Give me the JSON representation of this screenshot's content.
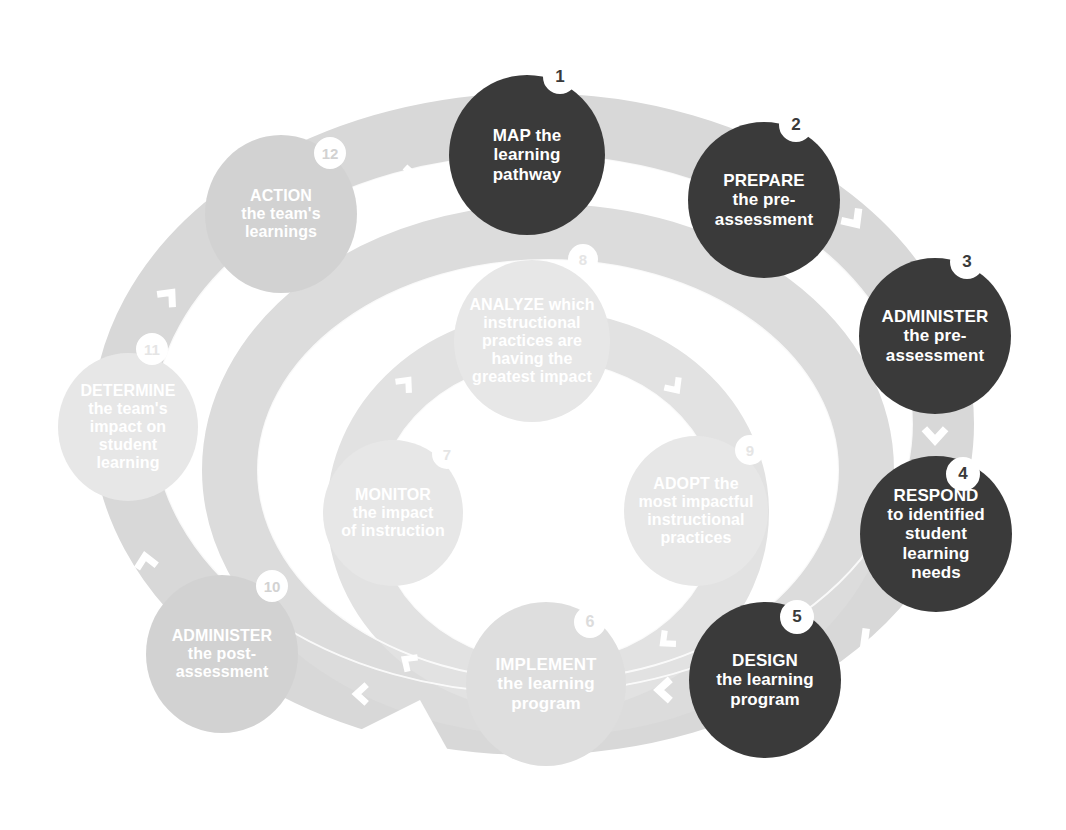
{
  "diagram": {
    "colors": {
      "active_fill": "#3a3a3a",
      "dim_fill": "#d2d2d2",
      "faint_fill": "#dedede",
      "faintest_fill": "#e7e7e7",
      "track": "#d8d8d8",
      "track_inner": "#dcdcdc",
      "arrow": "#ffffff",
      "text_on_active": "#ffffff",
      "background": "#ffffff"
    },
    "outer_ring_label": "outer-cycle-track",
    "inner_ring_label": "inner-cycle-track",
    "steps": [
      {
        "number": "1",
        "state": "active",
        "lines": [
          "MAP the",
          "learning",
          "pathway"
        ],
        "cx": 527,
        "cy": 155,
        "rx": 78,
        "ry": 80,
        "font": 17,
        "badge_x": 560,
        "badge_y": 77,
        "badge_r": 17,
        "badge_font": 17
      },
      {
        "number": "2",
        "state": "active",
        "lines": [
          "PREPARE",
          "the pre-",
          "assessment"
        ],
        "cx": 764,
        "cy": 200,
        "rx": 76,
        "ry": 78,
        "font": 17,
        "badge_x": 796,
        "badge_y": 125,
        "badge_r": 17,
        "badge_font": 17
      },
      {
        "number": "3",
        "state": "active",
        "lines": [
          "ADMINISTER",
          "the pre-",
          "assessment"
        ],
        "cx": 935,
        "cy": 336,
        "rx": 76,
        "ry": 78,
        "font": 17,
        "badge_x": 967,
        "badge_y": 262,
        "badge_r": 17,
        "badge_font": 17
      },
      {
        "number": "4",
        "state": "active",
        "lines": [
          "RESPOND",
          "to identified",
          "student",
          "learning",
          "needs"
        ],
        "cx": 936,
        "cy": 534,
        "rx": 76,
        "ry": 78,
        "font": 17,
        "badge_x": 963,
        "badge_y": 474,
        "badge_r": 17,
        "badge_font": 17
      },
      {
        "number": "5",
        "state": "active",
        "lines": [
          "DESIGN",
          "the learning",
          "program"
        ],
        "cx": 765,
        "cy": 680,
        "rx": 76,
        "ry": 78,
        "font": 17,
        "badge_x": 797,
        "badge_y": 617,
        "badge_r": 17,
        "badge_font": 17
      },
      {
        "number": "6",
        "state": "faint",
        "lines": [
          "IMPLEMENT",
          "the learning",
          "program"
        ],
        "cx": 546,
        "cy": 684,
        "rx": 80,
        "ry": 82,
        "font": 17,
        "badge_x": 590,
        "badge_y": 622,
        "badge_r": 16,
        "badge_font": 16
      },
      {
        "number": "7",
        "state": "faintest",
        "lines": [
          "MONITOR",
          "the impact",
          "of instruction"
        ],
        "cx": 393,
        "cy": 513,
        "rx": 70,
        "ry": 73,
        "font": 16,
        "badge_x": 447,
        "badge_y": 454,
        "badge_r": 15,
        "badge_font": 15
      },
      {
        "number": "8",
        "state": "faintest",
        "lines": [
          "ANALYZE which",
          "instructional",
          "practices are",
          "having the",
          "greatest impact"
        ],
        "cx": 532,
        "cy": 341,
        "rx": 78,
        "ry": 81,
        "font": 16,
        "badge_x": 583,
        "badge_y": 259,
        "badge_r": 15,
        "badge_font": 15
      },
      {
        "number": "9",
        "state": "faintest",
        "lines": [
          "ADOPT the",
          "most impactful",
          "instructional",
          "practices"
        ],
        "cx": 696,
        "cy": 511,
        "rx": 72,
        "ry": 75,
        "font": 16,
        "badge_x": 750,
        "badge_y": 450,
        "badge_r": 15,
        "badge_font": 15
      },
      {
        "number": "10",
        "state": "dim",
        "lines": [
          "ADMINISTER",
          "the post-",
          "assessment"
        ],
        "cx": 222,
        "cy": 654,
        "rx": 76,
        "ry": 79,
        "font": 16,
        "badge_x": 272,
        "badge_y": 586,
        "badge_r": 16,
        "badge_font": 15
      },
      {
        "number": "11",
        "state": "faintest",
        "lines": [
          "DETERMINE",
          "the team's",
          "impact on",
          "student",
          "learning"
        ],
        "cx": 128,
        "cy": 427,
        "rx": 70,
        "ry": 74,
        "font": 16,
        "badge_x": 152,
        "badge_y": 349,
        "badge_r": 16,
        "badge_font": 15
      },
      {
        "number": "12",
        "state": "dim",
        "lines": [
          "ACTION",
          "the team's",
          "learnings"
        ],
        "cx": 281,
        "cy": 214,
        "rx": 76,
        "ry": 79,
        "font": 16,
        "badge_x": 330,
        "badge_y": 153,
        "badge_r": 16,
        "badge_font": 15
      }
    ],
    "arrows": [
      {
        "name": "arrow-1-to-2",
        "x": 634,
        "y": 178,
        "rot": 0,
        "size": 34
      },
      {
        "name": "arrow-2-to-3",
        "x": 853,
        "y": 219,
        "rot": 55,
        "size": 34
      },
      {
        "name": "arrow-3-to-4",
        "x": 935,
        "y": 434,
        "rot": 90,
        "size": 34
      },
      {
        "name": "arrow-4-to-5",
        "x": 869,
        "y": 640,
        "rot": 140,
        "size": 34
      },
      {
        "name": "arrow-5-to-6",
        "x": 665,
        "y": 690,
        "rot": 180,
        "size": 34
      },
      {
        "name": "arrow-6-to-7",
        "x": 362,
        "y": 694,
        "rot": 180,
        "size": 30
      },
      {
        "name": "arrow-inner-7",
        "x": 409,
        "y": 662,
        "rot": 215,
        "size": 28
      },
      {
        "name": "arrow-7-to-8",
        "x": 405,
        "y": 384,
        "rot": 310,
        "size": 28
      },
      {
        "name": "arrow-8-to-9",
        "x": 674,
        "y": 386,
        "rot": 55,
        "size": 28
      },
      {
        "name": "arrow-9-to-6",
        "x": 667,
        "y": 640,
        "rot": 140,
        "size": 28
      },
      {
        "name": "arrow-10-to-11",
        "x": 146,
        "y": 562,
        "rot": 260,
        "size": 32
      },
      {
        "name": "arrow-11-to-12",
        "x": 168,
        "y": 297,
        "rot": 310,
        "size": 32
      },
      {
        "name": "arrow-12-to-1",
        "x": 410,
        "y": 177,
        "rot": 0,
        "size": 32
      }
    ]
  }
}
